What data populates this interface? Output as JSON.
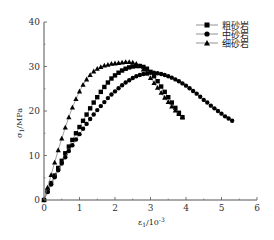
{
  "chart_data": {
    "type": "line",
    "title": "",
    "xlabel": "ε1/10^-3",
    "ylabel": "σ1/MPa",
    "xlim": [
      0,
      6
    ],
    "ylim": [
      0,
      40
    ],
    "xticks": [
      "0",
      "1",
      "2",
      "3",
      "4",
      "5",
      "6"
    ],
    "yticks": [
      "0",
      "10",
      "20",
      "30",
      "40"
    ],
    "grid": false,
    "legend_position": "upper right",
    "series": [
      {
        "name": "粗砂岩",
        "marker": "square",
        "x": [
          0,
          0.1,
          0.2,
          0.3,
          0.4,
          0.5,
          0.6,
          0.7,
          0.8,
          0.9,
          1.0,
          1.1,
          1.2,
          1.3,
          1.4,
          1.5,
          1.6,
          1.7,
          1.8,
          1.9,
          2.0,
          2.1,
          2.2,
          2.3,
          2.4,
          2.5,
          2.6,
          2.7,
          2.8,
          2.9,
          3.0,
          3.1,
          3.2,
          3.3,
          3.4,
          3.5,
          3.6,
          3.7,
          3.8,
          3.9
        ],
        "y": [
          0,
          2.0,
          3.8,
          5.5,
          7.2,
          8.8,
          10.5,
          12.0,
          13.5,
          15.0,
          16.4,
          17.8,
          19.2,
          20.6,
          21.9,
          23.1,
          24.3,
          25.4,
          26.4,
          27.3,
          28.0,
          28.6,
          29.1,
          29.5,
          29.8,
          30.0,
          30.1,
          30.1,
          29.9,
          29.5,
          28.8,
          27.8,
          26.7,
          25.5,
          24.3,
          23.1,
          21.9,
          20.7,
          19.6,
          18.6
        ]
      },
      {
        "name": "中砂岩",
        "marker": "circle",
        "x": [
          0,
          0.1,
          0.2,
          0.3,
          0.4,
          0.5,
          0.6,
          0.7,
          0.8,
          0.9,
          1.0,
          1.1,
          1.2,
          1.3,
          1.4,
          1.5,
          1.6,
          1.7,
          1.8,
          1.9,
          2.0,
          2.1,
          2.2,
          2.3,
          2.4,
          2.5,
          2.6,
          2.7,
          2.8,
          2.9,
          3.0,
          3.1,
          3.2,
          3.3,
          3.4,
          3.5,
          3.6,
          3.7,
          3.8,
          3.9,
          4.0,
          4.1,
          4.2,
          4.3,
          4.4,
          4.5,
          4.6,
          4.7,
          4.8,
          4.9,
          5.0,
          5.1,
          5.2,
          5.3
        ],
        "y": [
          0,
          1.8,
          3.5,
          5.1,
          6.7,
          8.2,
          9.6,
          11.0,
          12.3,
          13.6,
          14.8,
          16.0,
          17.1,
          18.2,
          19.2,
          20.2,
          21.1,
          22.0,
          22.9,
          23.7,
          24.4,
          25.1,
          25.8,
          26.4,
          26.9,
          27.4,
          27.8,
          28.1,
          28.3,
          28.5,
          28.6,
          28.6,
          28.5,
          28.3,
          28.1,
          27.8,
          27.5,
          27.1,
          26.7,
          26.2,
          25.7,
          25.1,
          24.5,
          23.9,
          23.2,
          22.5,
          21.9,
          21.2,
          20.6,
          20.0,
          19.4,
          18.8,
          18.3,
          17.8
        ]
      },
      {
        "name": "细砂岩",
        "marker": "triangle",
        "x": [
          0,
          0.1,
          0.2,
          0.3,
          0.4,
          0.5,
          0.6,
          0.7,
          0.8,
          0.9,
          1.0,
          1.1,
          1.2,
          1.3,
          1.4,
          1.5,
          1.6,
          1.7,
          1.8,
          1.9,
          2.0,
          2.1,
          2.2,
          2.3,
          2.4,
          2.5,
          2.6,
          2.7,
          2.8,
          2.9,
          3.0,
          3.1,
          3.2,
          3.3,
          3.4,
          3.5,
          3.6,
          3.7,
          3.8,
          3.9
        ],
        "y": [
          0,
          2.8,
          5.6,
          8.4,
          11.2,
          13.8,
          16.3,
          18.6,
          20.8,
          22.7,
          24.4,
          25.9,
          27.1,
          28.1,
          28.9,
          29.5,
          29.9,
          30.2,
          30.4,
          30.6,
          30.7,
          30.8,
          30.9,
          31.0,
          31.0,
          30.9,
          30.6,
          30.1,
          29.3,
          28.4,
          27.4,
          26.3,
          25.2,
          24.1,
          23.0,
          22.0,
          21.0,
          20.1,
          19.3,
          18.6
        ]
      }
    ]
  },
  "axes": {
    "x_tick_labels": [
      "0",
      "1",
      "2",
      "3",
      "4",
      "5",
      "6"
    ],
    "y_tick_labels": [
      "0",
      "10",
      "20",
      "30",
      "40"
    ],
    "x_title_main": "ε",
    "x_title_sub": "1",
    "x_title_rest": "/10",
    "x_title_sup": "-3",
    "y_title_main": "σ",
    "y_title_sub": "1",
    "y_title_rest": "/MPa"
  },
  "legend": {
    "items": [
      {
        "label": "粗砂岩",
        "marker": "square"
      },
      {
        "label": "中砂岩",
        "marker": "circle"
      },
      {
        "label": "细砂岩",
        "marker": "triangle"
      }
    ]
  },
  "colors": {
    "line": "#777777",
    "marker": "#000000",
    "axis": "#444444"
  }
}
